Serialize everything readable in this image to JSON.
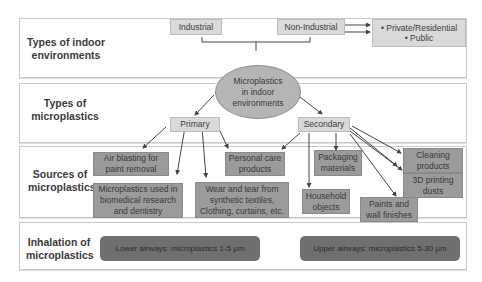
{
  "rows": [
    {
      "label_line1": "Types of indoor",
      "label_line2": "environments"
    },
    {
      "label_line1": "Types of",
      "label_line2": "microplastics"
    },
    {
      "label_line1": "Sources of",
      "label_line2": "microplastics"
    },
    {
      "label_line1": "Inhalation of",
      "label_line2": "microplastics"
    }
  ],
  "environments": {
    "industrial": "Industrial",
    "non_industrial": "Non-Industrial",
    "subtypes": [
      "Private/Residential",
      "Public"
    ],
    "bullet": "•"
  },
  "center": {
    "line1": "Microplastics",
    "line2": "in indoor",
    "line3": "environments"
  },
  "types": {
    "primary": "Primary",
    "secondary": "Secondary"
  },
  "sources": {
    "air_blasting": [
      "Air blasting for",
      "paint removal"
    ],
    "biomedical": [
      "Microplastics used in",
      "biomedical research",
      "and dentistry"
    ],
    "wear_tear": [
      "Wear and tear from",
      "synthetic textiles,",
      "Clothing, curtains, etc."
    ],
    "personal_care": [
      "Personal care",
      "products"
    ],
    "packaging": [
      "Packaging",
      "materials"
    ],
    "household": [
      "Household",
      "objects"
    ],
    "paints": [
      "Paints and",
      "wall finishes"
    ],
    "cleaning": [
      "Cleaning",
      "products"
    ],
    "printing": [
      "3D printing",
      "dusts"
    ]
  },
  "inhalation": {
    "lower": "Lower airways: microplastics 1-5 µm",
    "upper": "Upper airways: microplastics 5-30 µm"
  }
}
